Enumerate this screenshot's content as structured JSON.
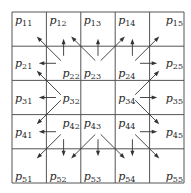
{
  "diagram": {
    "title": "",
    "grid": {
      "rows": 5,
      "cols": 5
    },
    "colors": {
      "line": "#555555",
      "arrow": "#333333",
      "text": "#2a2a2a"
    },
    "cells": [
      {
        "id": "p11",
        "base": "p",
        "sub": "11",
        "row": 1,
        "col": 1,
        "anchor": "top-left"
      },
      {
        "id": "p12",
        "base": "p",
        "sub": "12",
        "row": 1,
        "col": 2,
        "anchor": "top-left"
      },
      {
        "id": "p13",
        "base": "p",
        "sub": "13",
        "row": 1,
        "col": 3,
        "anchor": "top-left"
      },
      {
        "id": "p14",
        "base": "p",
        "sub": "14",
        "row": 1,
        "col": 4,
        "anchor": "top-left"
      },
      {
        "id": "p15",
        "base": "p",
        "sub": "15",
        "row": 1,
        "col": 5,
        "anchor": "top-right"
      },
      {
        "id": "p21",
        "base": "p",
        "sub": "21",
        "row": 2,
        "col": 1,
        "anchor": "middle-left"
      },
      {
        "id": "p22",
        "base": "p",
        "sub": "22",
        "row": 2,
        "col": 2,
        "anchor": "bottom-right"
      },
      {
        "id": "p23",
        "base": "p",
        "sub": "23",
        "row": 2,
        "col": 3,
        "anchor": "bottom-left"
      },
      {
        "id": "p24",
        "base": "p",
        "sub": "24",
        "row": 2,
        "col": 4,
        "anchor": "bottom-left"
      },
      {
        "id": "p25",
        "base": "p",
        "sub": "25",
        "row": 2,
        "col": 5,
        "anchor": "middle-right"
      },
      {
        "id": "p31",
        "base": "p",
        "sub": "31",
        "row": 3,
        "col": 1,
        "anchor": "middle-left"
      },
      {
        "id": "p32",
        "base": "p",
        "sub": "32",
        "row": 3,
        "col": 2,
        "anchor": "middle-right"
      },
      {
        "id": "p34",
        "base": "p",
        "sub": "34",
        "row": 3,
        "col": 4,
        "anchor": "middle-left"
      },
      {
        "id": "p35",
        "base": "p",
        "sub": "35",
        "row": 3,
        "col": 5,
        "anchor": "middle-right"
      },
      {
        "id": "p41",
        "base": "p",
        "sub": "41",
        "row": 4,
        "col": 1,
        "anchor": "middle-left"
      },
      {
        "id": "p42",
        "base": "p",
        "sub": "42",
        "row": 4,
        "col": 2,
        "anchor": "top-right"
      },
      {
        "id": "p43",
        "base": "p",
        "sub": "43",
        "row": 4,
        "col": 3,
        "anchor": "top-left"
      },
      {
        "id": "p44",
        "base": "p",
        "sub": "44",
        "row": 4,
        "col": 4,
        "anchor": "top-left"
      },
      {
        "id": "p45",
        "base": "p",
        "sub": "45",
        "row": 4,
        "col": 5,
        "anchor": "middle-right"
      },
      {
        "id": "p51",
        "base": "p",
        "sub": "51",
        "row": 5,
        "col": 1,
        "anchor": "bottom-left"
      },
      {
        "id": "p52",
        "base": "p",
        "sub": "52",
        "row": 5,
        "col": 2,
        "anchor": "bottom-left"
      },
      {
        "id": "p53",
        "base": "p",
        "sub": "53",
        "row": 5,
        "col": 3,
        "anchor": "bottom-left"
      },
      {
        "id": "p54",
        "base": "p",
        "sub": "54",
        "row": 5,
        "col": 4,
        "anchor": "bottom-left"
      },
      {
        "id": "p55",
        "base": "p",
        "sub": "55",
        "row": 5,
        "col": 5,
        "anchor": "bottom-right"
      }
    ],
    "arrows": [
      {
        "from": "p22",
        "to": "p11"
      },
      {
        "from": "p22",
        "to": "p12"
      },
      {
        "from": "p22",
        "to": "p21"
      },
      {
        "from": "p23",
        "to": "p12"
      },
      {
        "from": "p23",
        "to": "p13"
      },
      {
        "from": "p23",
        "to": "p14"
      },
      {
        "from": "p24",
        "to": "p14"
      },
      {
        "from": "p24",
        "to": "p15"
      },
      {
        "from": "p24",
        "to": "p25"
      },
      {
        "from": "p32",
        "to": "p21"
      },
      {
        "from": "p32",
        "to": "p31"
      },
      {
        "from": "p32",
        "to": "p41"
      },
      {
        "from": "p34",
        "to": "p25"
      },
      {
        "from": "p34",
        "to": "p35"
      },
      {
        "from": "p34",
        "to": "p45"
      },
      {
        "from": "p42",
        "to": "p41"
      },
      {
        "from": "p42",
        "to": "p51"
      },
      {
        "from": "p42",
        "to": "p52"
      },
      {
        "from": "p43",
        "to": "p52"
      },
      {
        "from": "p43",
        "to": "p53"
      },
      {
        "from": "p43",
        "to": "p54"
      },
      {
        "from": "p44",
        "to": "p45"
      },
      {
        "from": "p44",
        "to": "p54"
      },
      {
        "from": "p44",
        "to": "p55"
      }
    ]
  }
}
